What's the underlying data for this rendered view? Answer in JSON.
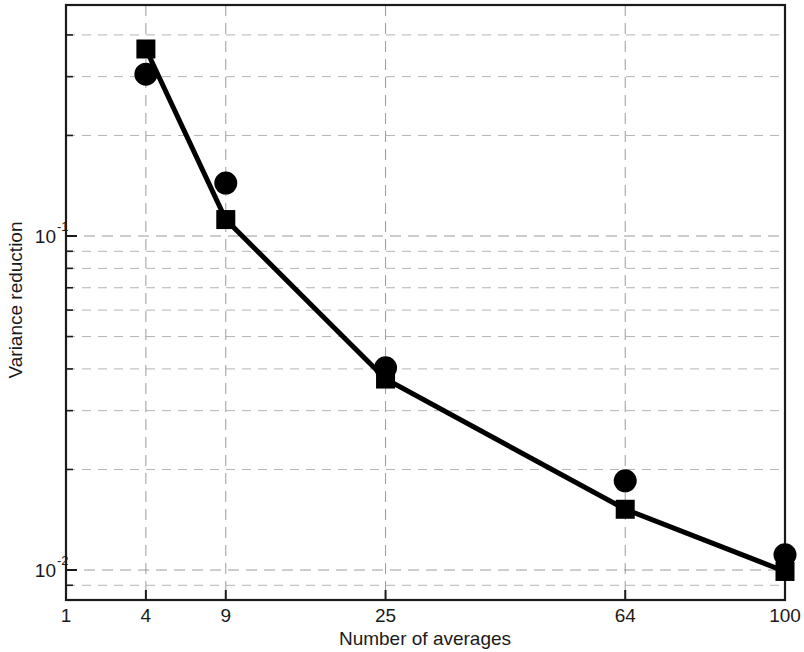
{
  "figure": {
    "background_color": "#ffffff",
    "foreground_color": "#000000",
    "grid_color": "#9a9a9a"
  },
  "axis": {
    "x_title": "Number of averages",
    "y_title": "Variance reduction",
    "y_tick_1_mantissa": "10",
    "y_tick_1_exponent": "-1",
    "y_tick_2_mantissa": "10",
    "y_tick_2_exponent": "-2",
    "x_tick_labels": [
      "1",
      "4",
      "9",
      "25",
      "64",
      "100"
    ]
  },
  "chart_data": {
    "type": "line",
    "title": "",
    "xlabel": "Number of averages",
    "ylabel": "Variance reduction",
    "xscale": "sqrt",
    "yscale": "log",
    "xlim": [
      1,
      100
    ],
    "ylim": [
      0.0077,
      0.55
    ],
    "grid": true,
    "legend": "none",
    "x_ticks": [
      1,
      4,
      9,
      25,
      64,
      100
    ],
    "x_tick_labels": [
      "1",
      "4",
      "9",
      "25",
      "64",
      "100"
    ],
    "y_major_ticks": [
      0.1,
      0.01
    ],
    "y_major_tick_labels": [
      "10^-1",
      "10^-2"
    ],
    "y_minor_ticks": [
      0.5,
      0.4,
      0.3,
      0.2,
      0.09,
      0.08,
      0.07,
      0.06,
      0.05,
      0.04,
      0.03,
      0.02,
      0.009
    ],
    "x": [
      4,
      9,
      25,
      64,
      100
    ],
    "series": [
      {
        "name": "theoretical",
        "marker": "square",
        "line": "solid",
        "color": "#000000",
        "values": [
          0.363,
          0.112,
          0.0373,
          0.0152,
          0.0099
        ]
      },
      {
        "name": "measured",
        "marker": "circle",
        "line": "none",
        "color": "#000000",
        "values": [
          0.305,
          0.144,
          0.0403,
          0.0185,
          0.0111
        ]
      }
    ]
  }
}
